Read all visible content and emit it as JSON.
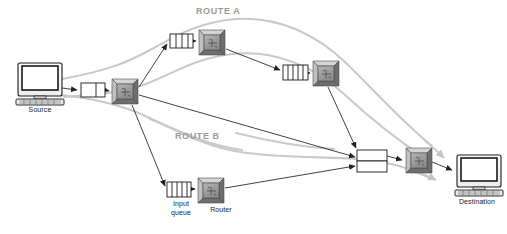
{
  "diagram": {
    "type": "network-routing-diagram",
    "colors": {
      "route_band": "#c9c9c9",
      "route_label": "#9a9a9a",
      "link_line": "#333333",
      "router_body": "#9e9e9e",
      "router_bevel_light": "#d8d8d8",
      "router_bevel_dark": "#5a5a5a",
      "queue_fill": "#ffffff",
      "queue_stroke": "#1a1a1a",
      "text": "#1a1a1a",
      "background": "#ffffff"
    },
    "route_labels": [
      {
        "id": "route-a",
        "text": "ROUTE A",
        "x": 196,
        "y": 6
      },
      {
        "id": "route-b",
        "text": "ROUTE B",
        "x": 175,
        "y": 131
      }
    ],
    "node_labels": [
      {
        "id": "source",
        "text": "Source",
        "x": 18,
        "y": 106,
        "w": 44
      },
      {
        "id": "input-queue",
        "text": "Input\nqueue",
        "x": 160,
        "y": 206,
        "w": 42
      },
      {
        "id": "router",
        "text": "Router",
        "x": 201,
        "y": 206,
        "w": 40
      },
      {
        "id": "destination",
        "text": "Destination",
        "x": 449,
        "y": 200,
        "w": 56
      }
    ],
    "nodes": [
      {
        "id": "source-computer",
        "kind": "computer",
        "label": "Source",
        "x": 16,
        "y": 63,
        "w": 48,
        "h": 40
      },
      {
        "id": "queue-1",
        "kind": "queue",
        "x": 81,
        "y": 83,
        "w": 24,
        "h": 14,
        "slots": 2
      },
      {
        "id": "router-1",
        "kind": "router",
        "x": 112,
        "y": 79,
        "w": 26,
        "h": 25
      },
      {
        "id": "queue-a1",
        "kind": "queue",
        "x": 170,
        "y": 34,
        "w": 23,
        "h": 14,
        "slots": 3
      },
      {
        "id": "router-a1",
        "kind": "router",
        "x": 199,
        "y": 30,
        "w": 26,
        "h": 25
      },
      {
        "id": "queue-a2",
        "kind": "queue",
        "x": 283,
        "y": 65,
        "w": 25,
        "h": 15,
        "slots": 4
      },
      {
        "id": "router-a2",
        "kind": "router",
        "x": 313,
        "y": 61,
        "w": 26,
        "h": 25
      },
      {
        "id": "queue-b1",
        "kind": "queue",
        "x": 167,
        "y": 182,
        "w": 24,
        "h": 15,
        "slots": 4
      },
      {
        "id": "router-b1",
        "kind": "router",
        "x": 198,
        "y": 178,
        "w": 26,
        "h": 25
      },
      {
        "id": "queue-final-top",
        "kind": "queue-plain",
        "x": 357,
        "y": 150,
        "w": 30,
        "h": 11
      },
      {
        "id": "queue-final-bottom",
        "kind": "queue-plain",
        "x": 357,
        "y": 161,
        "w": 30,
        "h": 11
      },
      {
        "id": "router-final",
        "kind": "router",
        "x": 406,
        "y": 148,
        "w": 26,
        "h": 25
      },
      {
        "id": "destination-computer",
        "kind": "computer",
        "label": "Destination",
        "x": 455,
        "y": 155,
        "w": 46,
        "h": 40
      }
    ],
    "links": [
      {
        "id": "link-source-queue1",
        "from": "source-computer",
        "to": "queue-1"
      },
      {
        "id": "link-queue1-router1",
        "from": "queue-1",
        "to": "router-1"
      },
      {
        "id": "link-router1-queuea1",
        "from": "router-1",
        "to": "queue-a1"
      },
      {
        "id": "link-queuea1-routera1",
        "from": "queue-a1",
        "to": "router-a1"
      },
      {
        "id": "link-routera1-queuea2",
        "from": "router-a1",
        "to": "queue-a2"
      },
      {
        "id": "link-queuea2-routera2",
        "from": "queue-a2",
        "to": "router-a2"
      },
      {
        "id": "link-routera2-final",
        "from": "router-a2",
        "to": "queue-final-top"
      },
      {
        "id": "link-router1-queueb1",
        "from": "router-1",
        "to": "queue-b1"
      },
      {
        "id": "link-queueb1-routerb1",
        "from": "queue-b1",
        "to": "router-b1"
      },
      {
        "id": "link-routerb1-final",
        "from": "router-b1",
        "to": "queue-final-bottom"
      },
      {
        "id": "link-router1-final-direct",
        "from": "router-1",
        "to": "queue-final-top"
      },
      {
        "id": "link-final-router",
        "from": "queue-final-top",
        "to": "router-final"
      },
      {
        "id": "link-router-destination",
        "from": "router-final",
        "to": "destination-computer"
      }
    ],
    "route_bands": [
      {
        "id": "band-a",
        "label": "ROUTE A",
        "description": "upper grey ribbon from source through route A routers to destination"
      },
      {
        "id": "band-b",
        "label": "ROUTE B",
        "description": "lower grey ribbon from source through route B router to destination"
      }
    ]
  }
}
